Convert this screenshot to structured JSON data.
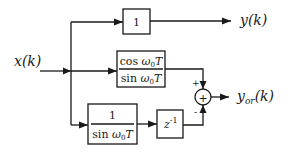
{
  "diagram": {
    "input_label": "x(k)",
    "output_top_label": "y(k)",
    "output_sum_label_main": "y",
    "output_sum_label_sub": "or",
    "output_sum_label_arg": "(k)",
    "block_gain": {
      "text": "1"
    },
    "block_cos_sin": {
      "numerator_fn": "cos ",
      "numerator_var": "ω",
      "numerator_sub": "0",
      "numerator_T": "T",
      "denominator_fn": "sin ",
      "denominator_var": "ω",
      "denominator_sub": "0",
      "denominator_T": "T"
    },
    "block_inv_sin": {
      "numerator": "1",
      "denominator_fn": "sin ",
      "denominator_var": "ω",
      "denominator_sub": "0",
      "denominator_T": "T"
    },
    "block_delay": {
      "base": "z",
      "exponent": "-1"
    },
    "sum_junction": {
      "symbol": "+",
      "sign_top": "+",
      "sign_bottom": "-"
    }
  }
}
